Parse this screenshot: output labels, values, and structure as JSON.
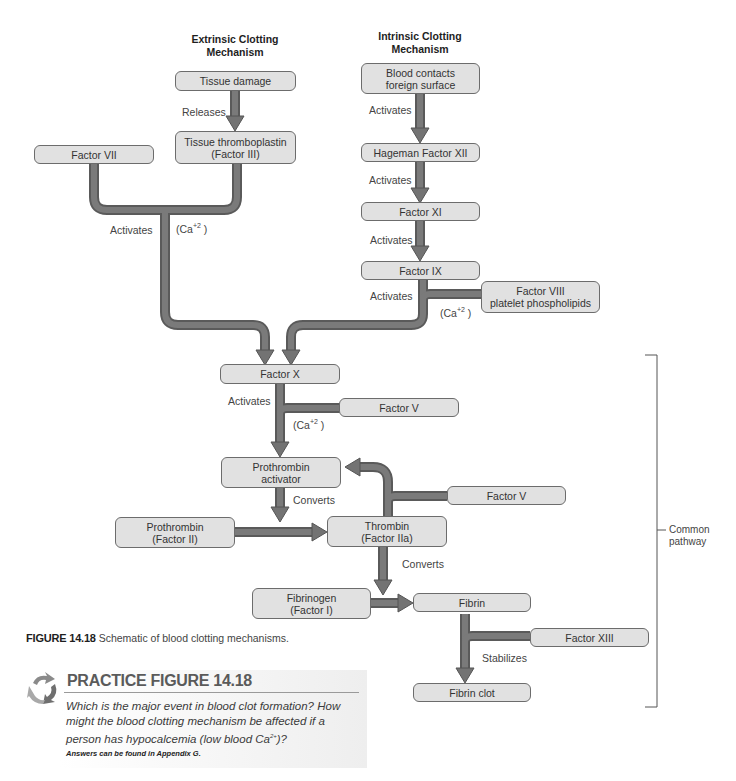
{
  "headings": {
    "extrinsic": "Extrinsic Clotting Mechanism",
    "intrinsic": "Intrinsic Clotting Mechanism"
  },
  "boxes": {
    "tissue_damage": "Tissue damage",
    "tissue_thromboplastin": "Tissue thromboplastin (Factor III)",
    "factor_vii": "Factor VII",
    "blood_contacts": "Blood contacts foreign surface",
    "hageman_factor_xii": "Hageman Factor XII",
    "factor_xi": "Factor XI",
    "factor_ix": "Factor IX",
    "factor_viii": "Factor VIII platelet phospholipids",
    "factor_x": "Factor X",
    "factor_v_1": "Factor V",
    "prothrombin_activator": "Prothrombin activator",
    "factor_v_2": "Factor V",
    "prothrombin": "Prothrombin (Factor II)",
    "thrombin": "Thrombin (Factor IIa)",
    "fibrinogen": "Fibrinogen (Factor I)",
    "fibrin": "Fibrin",
    "factor_xiii": "Factor XIII",
    "fibrin_clot": "Fibrin clot"
  },
  "box_lines": {
    "tissue_thromboplastin": [
      "Tissue thromboplastin",
      "(Factor III)"
    ],
    "blood_contacts": [
      "Blood contacts",
      "foreign surface"
    ],
    "factor_viii": [
      "Factor VIII",
      "platelet phospholipids"
    ],
    "prothrombin_activator": [
      "Prothrombin",
      "activator"
    ],
    "prothrombin": [
      "Prothrombin",
      "(Factor II)"
    ],
    "thrombin": [
      "Thrombin",
      "(Factor IIa)"
    ],
    "fibrinogen": [
      "Fibrinogen",
      "(Factor I)"
    ]
  },
  "labels": {
    "releases": "Releases",
    "activates_extrinsic": "Activates",
    "activates_1": "Activates",
    "activates_2": "Activates",
    "activates_3": "Activates",
    "activates_4": "Activates",
    "activates_x": "Activates",
    "converts_1": "Converts",
    "converts_2": "Converts",
    "stabilizes": "Stabilizes",
    "ca_base": "(Ca",
    "ca_sup": "+2",
    "ca_close": " )"
  },
  "bracket": {
    "label_line1": "Common",
    "label_line2": "pathway"
  },
  "caption": {
    "number": "FIGURE 14.18",
    "text": "Schematic of blood clotting mechanisms."
  },
  "practice": {
    "title": "PRACTICE FIGURE 14.18",
    "question_part1": "Which is the major event in blood clot formation? How might the blood clotting mechanism be affected if a person has hypocalcemia (low blood Ca",
    "question_sup": "2+",
    "question_part2": ")?",
    "answers_note": "Answers can be found in Appendix G."
  },
  "colors": {
    "box_fill": "#e1e1e1",
    "box_border": "#6c6c6c",
    "arrow_fill": "#737373",
    "arrow_edge": "#555555",
    "bracket": "#555555"
  }
}
